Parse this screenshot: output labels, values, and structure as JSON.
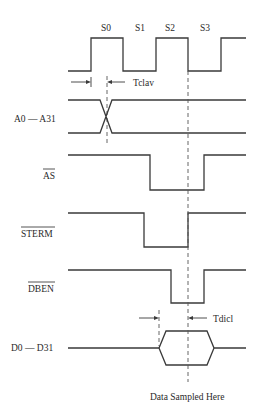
{
  "diagram": {
    "clock_states": [
      "S0",
      "S1",
      "S2",
      "S3"
    ],
    "signals": [
      {
        "id": "addr",
        "label": "A0 — A31",
        "overbar": false
      },
      {
        "id": "as",
        "label": "AS",
        "overbar": true
      },
      {
        "id": "sterm",
        "label": "STERM",
        "overbar": true
      },
      {
        "id": "dben",
        "label": "DBEN",
        "overbar": true
      },
      {
        "id": "data",
        "label": "D0 — D31",
        "overbar": false
      }
    ],
    "timing_labels": {
      "tclav": "Tclav",
      "tdicl": "Tdicl"
    },
    "annotation": "Data Sampled Here"
  }
}
